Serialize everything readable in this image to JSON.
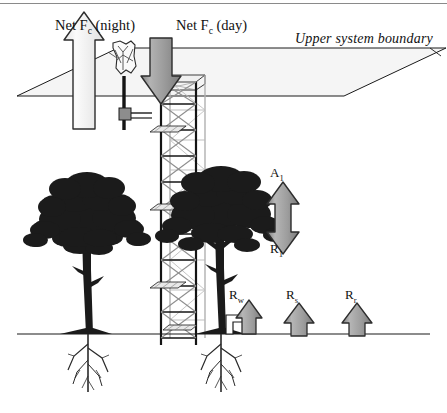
{
  "figure": {
    "background_color": "#ffffff",
    "line_color": "#1a1a1a",
    "arrow_fill_gray": "#9d9d9d",
    "arrow_fill_white": "#f2f2f2",
    "plane_fill": "#f4f4f4"
  },
  "labels": {
    "net_fc_night": "Net F",
    "net_fc_night_sub": "c",
    "net_fc_night_tail": " (night)",
    "net_fc_day": "Net F",
    "net_fc_day_sub": "c",
    "net_fc_day_tail": " (day)",
    "upper_boundary": "Upper system boundary",
    "a1": "A",
    "a1_sub": "1",
    "r1": "R",
    "r1_sub": "1",
    "rw": "R",
    "rw_sub": "w",
    "rs": "R",
    "rs_sub": "s",
    "rr": "R",
    "rr_sub": "r"
  },
  "elements": {
    "tower_name": "flux-measurement-lattice-tower",
    "anemometer_name": "sonic-anemometer",
    "tree_left_name": "tree-silhouette-left",
    "tree_right_name": "tree-silhouette-right",
    "ground_line_name": "ground-surface-line",
    "upper_plane_name": "upper-system-boundary-plane"
  },
  "arrows": {
    "night_flux": {
      "direction": "up",
      "fill": "white"
    },
    "day_flux": {
      "direction": "down",
      "fill": "gray"
    },
    "assimilation_respiration": {
      "direction": "double",
      "fill": "gray"
    },
    "woody_respiration": {
      "direction": "up",
      "fill": "gray"
    },
    "soil_respiration": {
      "direction": "up",
      "fill": "gray"
    },
    "root_respiration": {
      "direction": "up",
      "fill": "gray"
    }
  }
}
